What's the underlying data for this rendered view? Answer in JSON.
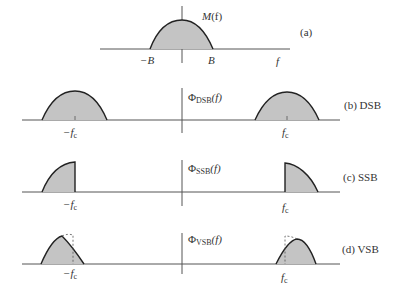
{
  "panels": [
    {
      "id": "a",
      "caption": "(a)",
      "function_label": {
        "symbol": "M",
        "arg": "(f)"
      },
      "ticks": [
        "−B",
        "B"
      ],
      "axis_label": "f"
    },
    {
      "id": "b",
      "caption": "(b) DSB",
      "function_label": {
        "symbol": "Φ",
        "sub": "DSB",
        "arg": "(f)"
      },
      "ticks": [
        "−f",
        "f"
      ],
      "tick_sub": "c"
    },
    {
      "id": "c",
      "caption": "(c) SSB",
      "function_label": {
        "symbol": "Φ",
        "sub": "SSB",
        "arg": "(f)"
      },
      "ticks": [
        "−f",
        "f"
      ],
      "tick_sub": "c"
    },
    {
      "id": "d",
      "caption": "(d) VSB",
      "function_label": {
        "symbol": "Φ",
        "sub": "VSB",
        "arg": "(f)"
      },
      "ticks": [
        "−f",
        "f"
      ],
      "tick_sub": "c"
    }
  ],
  "colors": {
    "fill": "#c4c4c4",
    "stroke": "#222222",
    "axis": "#555555"
  }
}
